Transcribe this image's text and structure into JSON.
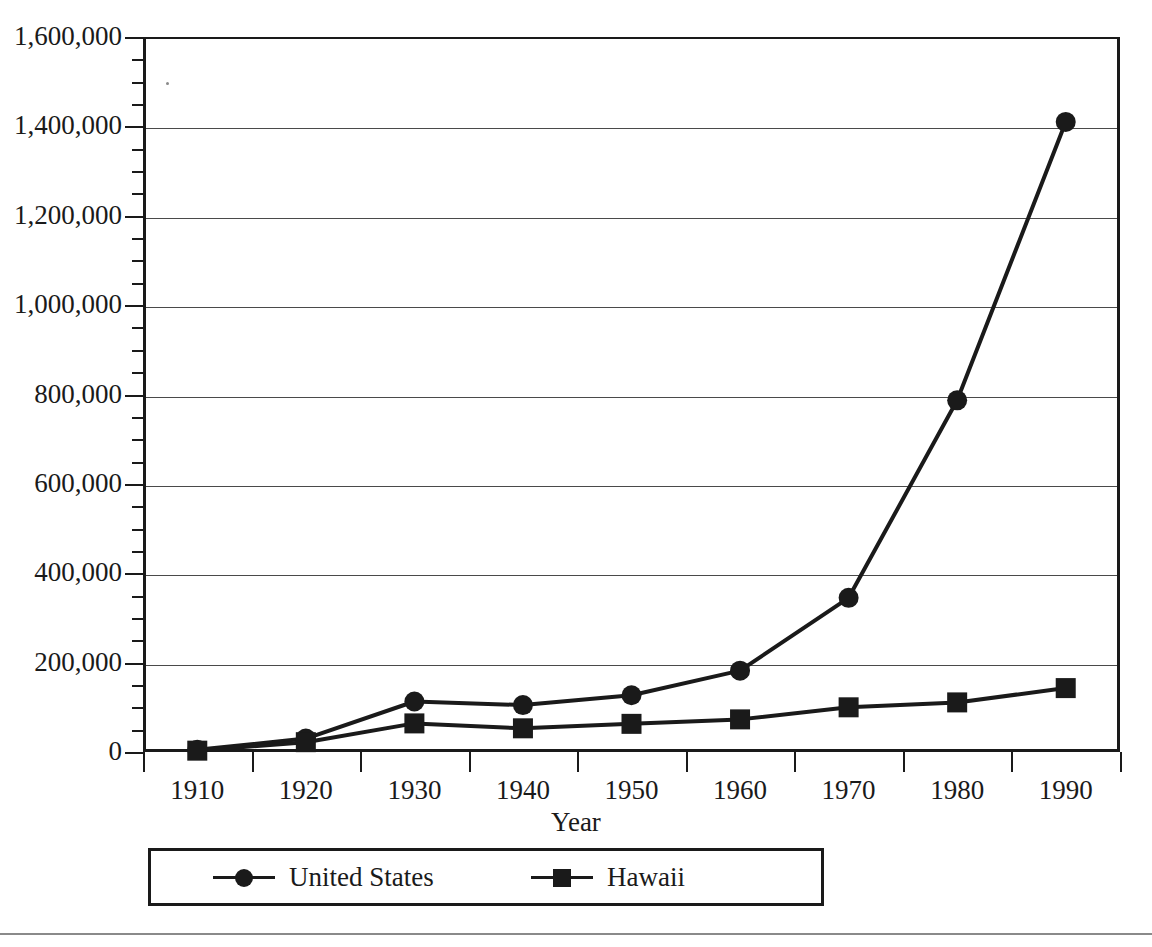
{
  "chart_data": {
    "type": "line",
    "title": "",
    "xlabel": "Year",
    "ylabel": "",
    "categories": [
      "1910",
      "1920",
      "1930",
      "1940",
      "1950",
      "1960",
      "1970",
      "1980",
      "1990"
    ],
    "x": [
      1910,
      1920,
      1930,
      1940,
      1950,
      1960,
      1970,
      1980,
      1990
    ],
    "ylim": [
      0,
      1600000
    ],
    "xlim_categories": true,
    "grid": "horizontal",
    "legend_position": "bottom",
    "y_major_interval": 200000,
    "y_minor_interval": 50000,
    "ytick_labels": [
      "0",
      "200,000",
      "400,000",
      "600,000",
      "800,000",
      "1,000,000",
      "1,200,000",
      "1,400,000",
      "1,600,000"
    ],
    "ytick_values": [
      0,
      200000,
      400000,
      600000,
      800000,
      1000000,
      1200000,
      1400000,
      1600000
    ],
    "series": [
      {
        "name": "United States",
        "marker": "circle",
        "color": "#1a1a1a",
        "values": [
          5000,
          30000,
          113000,
          105000,
          127000,
          182000,
          345000,
          787000,
          1410000
        ]
      },
      {
        "name": "Hawaii",
        "marker": "square",
        "color": "#1a1a1a",
        "values": [
          3000,
          22000,
          64000,
          53000,
          63000,
          73000,
          100000,
          111000,
          143000
        ]
      }
    ]
  },
  "legend": {
    "entries": [
      {
        "label": "United States",
        "marker": "circle-marker"
      },
      {
        "label": "Hawaii",
        "marker": "square-marker"
      }
    ]
  },
  "axes": {
    "x_title": "Year"
  },
  "colors": {
    "foreground": "#1a1a1a",
    "gridline": "#4a4a4a",
    "rule": "#8a8a8a"
  }
}
